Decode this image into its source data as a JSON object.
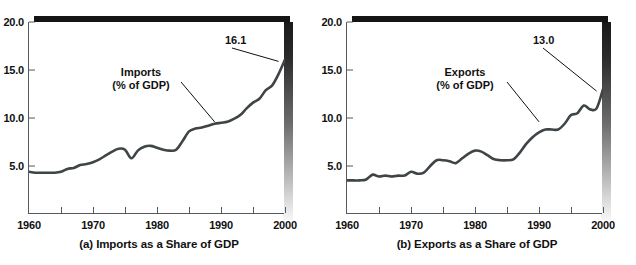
{
  "figure": {
    "background": "#ffffff",
    "line_color": "#3f4447",
    "axis_color": "#555a5e"
  },
  "panels": [
    {
      "id": "imports",
      "caption": "(a) Imports as a Share of GDP",
      "series_label_line1": "Imports",
      "series_label_line2": "(% of GDP)",
      "end_value_label": "16.1",
      "chart_data": {
        "type": "line",
        "title": "(a) Imports as a Share of GDP",
        "xlabel": "",
        "ylabel": "",
        "series_name": "Imports (% of GDP)",
        "xlim": [
          1960,
          2000
        ],
        "ylim": [
          0,
          20
        ],
        "yticks": [
          5.0,
          10.0,
          15.0,
          20.0
        ],
        "ytick_labels": [
          "5.0",
          "10.0",
          "15.0",
          "20.0"
        ],
        "xticks": [
          1960,
          1970,
          1980,
          1990,
          2000
        ],
        "xtick_labels": [
          "1960",
          "1970",
          "1980",
          "1990",
          "2000"
        ],
        "minor_xticks": [
          1965,
          1975,
          1985,
          1995
        ],
        "grid": false,
        "legend": "inline-annotation",
        "annotations": [
          {
            "text": "Imports\n(% of GDP)",
            "anchor_year": 1989,
            "anchor_value": 9.6
          },
          {
            "text": "16.1",
            "anchor_year": 1999,
            "anchor_value": 15.9
          }
        ],
        "x": [
          1960,
          1961,
          1962,
          1963,
          1964,
          1965,
          1966,
          1967,
          1968,
          1969,
          1970,
          1971,
          1972,
          1973,
          1974,
          1975,
          1976,
          1977,
          1978,
          1979,
          1980,
          1981,
          1982,
          1983,
          1984,
          1985,
          1986,
          1987,
          1988,
          1989,
          1990,
          1991,
          1992,
          1993,
          1994,
          1995,
          1996,
          1997,
          1998,
          1999,
          2000
        ],
        "y": [
          4.4,
          4.3,
          4.3,
          4.3,
          4.3,
          4.4,
          4.7,
          4.8,
          5.1,
          5.2,
          5.4,
          5.7,
          6.1,
          6.5,
          6.8,
          6.7,
          5.8,
          6.6,
          7.0,
          7.1,
          6.9,
          6.7,
          6.6,
          6.7,
          7.6,
          8.6,
          8.9,
          9.0,
          9.2,
          9.4,
          9.5,
          9.6,
          9.9,
          10.3,
          11.0,
          11.6,
          12.0,
          12.9,
          13.4,
          14.6,
          16.1
        ]
      }
    },
    {
      "id": "exports",
      "caption": "(b) Exports as a Share of GDP",
      "series_label_line1": "Exports",
      "series_label_line2": "(% of GDP)",
      "end_value_label": "13.0",
      "chart_data": {
        "type": "line",
        "title": "(b) Exports as a Share of GDP",
        "xlabel": "",
        "ylabel": "",
        "series_name": "Exports (% of GDP)",
        "xlim": [
          1960,
          2000
        ],
        "ylim": [
          0,
          20
        ],
        "yticks": [
          5.0,
          10.0,
          15.0,
          20.0
        ],
        "ytick_labels": [
          "5.0",
          "10.0",
          "15.0",
          "20.0"
        ],
        "xticks": [
          1960,
          1970,
          1980,
          1990,
          2000
        ],
        "xtick_labels": [
          "1960",
          "1970",
          "1980",
          "1990",
          "2000"
        ],
        "minor_xticks": [
          1965,
          1975,
          1985,
          1995
        ],
        "grid": false,
        "legend": "inline-annotation",
        "annotations": [
          {
            "text": "Exports\n(% of GDP)",
            "anchor_year": 1990,
            "anchor_value": 9.6
          },
          {
            "text": "13.0",
            "anchor_year": 1999,
            "anchor_value": 12.8
          }
        ],
        "x": [
          1960,
          1961,
          1962,
          1963,
          1964,
          1965,
          1966,
          1967,
          1968,
          1969,
          1970,
          1971,
          1972,
          1973,
          1974,
          1975,
          1976,
          1977,
          1978,
          1979,
          1980,
          1981,
          1982,
          1983,
          1984,
          1985,
          1986,
          1987,
          1988,
          1989,
          1990,
          1991,
          1992,
          1993,
          1994,
          1995,
          1996,
          1997,
          1998,
          1999,
          2000
        ],
        "y": [
          3.5,
          3.5,
          3.5,
          3.6,
          4.1,
          3.9,
          4.0,
          3.9,
          4.0,
          4.0,
          4.4,
          4.2,
          4.3,
          5.0,
          5.6,
          5.6,
          5.5,
          5.3,
          5.8,
          6.3,
          6.6,
          6.5,
          6.1,
          5.7,
          5.6,
          5.6,
          5.7,
          6.4,
          7.3,
          8.0,
          8.5,
          8.8,
          8.8,
          8.8,
          9.4,
          10.3,
          10.5,
          11.3,
          10.9,
          11.0,
          13.0
        ]
      }
    }
  ]
}
